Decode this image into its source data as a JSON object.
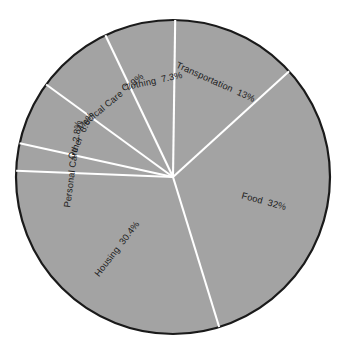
{
  "chart_data": {
    "type": "pie",
    "title": "",
    "subtitle": "",
    "xlabel": "",
    "ylabel": "",
    "legend": "none",
    "grid": false,
    "labels_rotated": true,
    "label_position": "inside-radial",
    "total_percent": "100%",
    "categories": [
      "Clothing",
      "Medical Care",
      "Other",
      "Personal Care",
      "Housing",
      "Food",
      "Transportation"
    ],
    "values": [
      7.3,
      7.9,
      6.6,
      2.8,
      30.4,
      32,
      13
    ],
    "slices": [
      {
        "name": "Clothing",
        "value": 7.3,
        "label": "Clothing  7.3%",
        "start_angle_deg": 89.2,
        "end_angle_deg": 115.5,
        "label_angle_deg": 102.3,
        "label_rotation_deg": 12.3,
        "label_radius": 0.62
      },
      {
        "name": "Medical Care",
        "value": 7.9,
        "label": "Medical Care  7.9%",
        "start_angle_deg": 115.5,
        "end_angle_deg": 143.9,
        "label_angle_deg": 129.7,
        "label_rotation_deg": 39.7,
        "label_radius": 0.62
      },
      {
        "name": "Other",
        "value": 6.6,
        "label": "Other  6.6%",
        "start_angle_deg": 143.9,
        "end_angle_deg": 167.6,
        "label_angle_deg": 155.8,
        "label_rotation_deg": 65.8,
        "label_radius": 0.64
      },
      {
        "name": "Personal Care",
        "value": 2.8,
        "label": "Personal Care  2.8%",
        "start_angle_deg": 167.6,
        "end_angle_deg": 177.7,
        "label_angle_deg": 172.6,
        "label_rotation_deg": 82.6,
        "label_radius": 0.64
      },
      {
        "name": "Housing",
        "value": 30.4,
        "label": "Housing  30.4%",
        "start_angle_deg": 177.7,
        "end_angle_deg": 287.1,
        "label_angle_deg": 232.4,
        "label_rotation_deg": 52.4,
        "label_radius": 0.58
      },
      {
        "name": "Food",
        "value": 32,
        "label": "Food  32%",
        "start_angle_deg": 287.1,
        "end_angle_deg": 402.3,
        "label_angle_deg": 344.7,
        "label_rotation_deg": -15.3,
        "label_radius": 0.6
      },
      {
        "name": "Transportation",
        "value": 13,
        "label": "Transportation  13%",
        "start_angle_deg": 42.3,
        "end_angle_deg": 89.2,
        "label_angle_deg": 65.8,
        "label_rotation_deg": -24.2,
        "label_radius": 0.66
      }
    ],
    "style": {
      "slice_fill": "#a3a3a3",
      "outline_color": "#1a1a1a",
      "outline_width": 2.2,
      "divider_color": "#ffffff",
      "divider_width": 2.1,
      "label_color": "#1c1c1c",
      "background": "#ffffff",
      "center_x": 173,
      "center_y": 177,
      "radius": 157
    }
  }
}
